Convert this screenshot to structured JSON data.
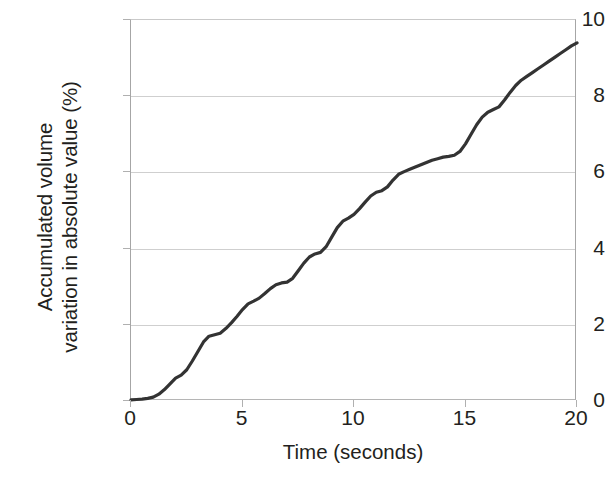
{
  "chart_data": {
    "type": "line",
    "title": "",
    "subtitle": "",
    "xlabel": "Time (seconds)",
    "ylabel": "Accumulated volume variation in absolute value (%)",
    "ylabel_lines": [
      "Accumulated volume",
      "variation in absolute value (%)"
    ],
    "xlim": [
      0,
      20
    ],
    "ylim": [
      0,
      10
    ],
    "xticks": [
      0,
      5,
      10,
      15,
      20
    ],
    "yticks": [
      0,
      2,
      4,
      6,
      8,
      10
    ],
    "xtick_labels": [
      "0",
      "5",
      "10",
      "15",
      "20"
    ],
    "ytick_labels": [
      "0",
      "2",
      "4",
      "6",
      "8",
      "10"
    ],
    "grid": "horizontal",
    "legend": "none",
    "line_color": "#333333",
    "line_width": 3.2,
    "grid_color": "#cfcfcf",
    "axis_color": "#a6a6a6",
    "background": "#ffffff",
    "series": [
      {
        "name": "Accumulated volume variation",
        "x": [
          0.0,
          0.25,
          0.5,
          0.75,
          1.0,
          1.25,
          1.5,
          1.75,
          2.0,
          2.25,
          2.5,
          2.75,
          3.0,
          3.25,
          3.5,
          3.75,
          4.0,
          4.25,
          4.5,
          4.75,
          5.0,
          5.25,
          5.5,
          5.75,
          6.0,
          6.25,
          6.5,
          6.75,
          7.0,
          7.25,
          7.5,
          7.75,
          8.0,
          8.25,
          8.5,
          8.75,
          9.0,
          9.25,
          9.5,
          9.75,
          10.0,
          10.25,
          10.5,
          10.75,
          11.0,
          11.25,
          11.5,
          11.75,
          12.0,
          12.25,
          12.5,
          12.75,
          13.0,
          13.25,
          13.5,
          13.75,
          14.0,
          14.25,
          14.5,
          14.75,
          15.0,
          15.25,
          15.5,
          15.75,
          16.0,
          16.25,
          16.5,
          16.75,
          17.0,
          17.25,
          17.5,
          17.75,
          18.0,
          18.25,
          18.5,
          18.75,
          19.0,
          19.25,
          19.5,
          19.75,
          20.0
        ],
        "y": [
          0.03,
          0.04,
          0.05,
          0.07,
          0.1,
          0.18,
          0.3,
          0.45,
          0.6,
          0.68,
          0.82,
          1.05,
          1.3,
          1.55,
          1.7,
          1.74,
          1.78,
          1.9,
          2.05,
          2.22,
          2.4,
          2.55,
          2.62,
          2.7,
          2.82,
          2.95,
          3.05,
          3.1,
          3.12,
          3.22,
          3.42,
          3.62,
          3.78,
          3.86,
          3.9,
          4.05,
          4.3,
          4.55,
          4.72,
          4.8,
          4.9,
          5.05,
          5.22,
          5.38,
          5.48,
          5.52,
          5.62,
          5.8,
          5.95,
          6.02,
          6.08,
          6.14,
          6.2,
          6.26,
          6.32,
          6.36,
          6.4,
          6.42,
          6.45,
          6.55,
          6.75,
          7.0,
          7.25,
          7.45,
          7.58,
          7.65,
          7.72,
          7.9,
          8.1,
          8.28,
          8.42,
          8.52,
          8.62,
          8.72,
          8.82,
          8.92,
          9.02,
          9.12,
          9.22,
          9.32,
          9.4
        ],
        "notes": "Monotonically increasing accumulated curve from ~0 at t=0 to ~9.75 at t=20, with short plateaus near t=3 (~1.75), t=7 (~3.1), t=8.4 (~3.9) and t=12.5-14 (~6.4)."
      }
    ],
    "endpoint": {
      "x": 20,
      "y": 9.75
    }
  }
}
